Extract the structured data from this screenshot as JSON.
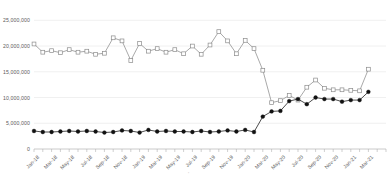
{
  "chart_data": {
    "type": "line",
    "title": "",
    "subtitle": "",
    "xlabel": "",
    "ylabel": "",
    "ylim": [
      0,
      27000000
    ],
    "yticks": [
      0,
      5000000,
      10000000,
      15000000,
      20000000,
      25000000
    ],
    "ytick_labels": [
      "0",
      "5,000,000",
      "10,000,000",
      "15,000,000",
      "20,000,000",
      "25,000,000"
    ],
    "grid": true,
    "grid_axis": "y",
    "legend": "none",
    "x": [
      "Jan-18",
      "Feb-18",
      "Mar-18",
      "Apr-18",
      "May-18",
      "Jun-18",
      "Jul-18",
      "Aug-18",
      "Sep-18",
      "Oct-18",
      "Nov-18",
      "Dec-18",
      "Jan-19",
      "Feb-19",
      "Mar-19",
      "Apr-19",
      "May-19",
      "Jun-19",
      "Jul-19",
      "Aug-19",
      "Sep-19",
      "Oct-19",
      "Nov-19",
      "Dec-19",
      "Jan-20",
      "Feb-20",
      "Mar-20",
      "Apr-20",
      "May-20",
      "Jun-20",
      "Jul-20",
      "Aug-20",
      "Sep-20",
      "Oct-20",
      "Nov-20",
      "Dec-20",
      "Jan-21",
      "Feb-21",
      "Mar-21",
      "Apr-21",
      "May-21"
    ],
    "xtick_labels": [
      "Jan-18",
      "Mar-18",
      "May-18",
      "Jul-18",
      "Sep-18",
      "Nov-18",
      "Jan-19",
      "Mar-19",
      "May-19",
      "Jul-19",
      "Sep-19",
      "Nov-19",
      "Jan-20",
      "Mar-20",
      "May-20",
      "Jul-20",
      "Sep-20",
      "Nov-20",
      "Jan-21",
      "Mar-21"
    ],
    "xtick_step": 2,
    "series": [
      {
        "name": "series-open-square",
        "marker": "open-square",
        "color": "#8c8c8c",
        "fill": "#ffffff",
        "values": [
          20400000,
          18800000,
          19100000,
          18700000,
          19300000,
          18800000,
          19000000,
          18400000,
          18600000,
          21600000,
          21000000,
          17200000,
          20500000,
          19000000,
          19500000,
          18800000,
          19300000,
          18500000,
          20000000,
          18400000,
          20200000,
          22800000,
          21000000,
          18500000,
          21100000,
          19500000,
          15300000,
          9000000,
          9400000,
          10400000,
          9500000,
          12000000,
          13400000,
          11800000,
          11500000,
          11500000,
          11400000,
          11300000,
          15500000,
          null,
          null
        ]
      },
      {
        "name": "series-filled-circle",
        "marker": "filled-circle",
        "color": "#111111",
        "fill": "#111111",
        "values": [
          3500000,
          3300000,
          3300000,
          3400000,
          3500000,
          3400000,
          3500000,
          3400000,
          3200000,
          3300000,
          3600000,
          3500000,
          3200000,
          3700000,
          3400000,
          3500000,
          3400000,
          3400000,
          3300000,
          3500000,
          3300000,
          3400000,
          3600000,
          3400000,
          3700000,
          3300000,
          6300000,
          7300000,
          7400000,
          9300000,
          9700000,
          8700000,
          10000000,
          9700000,
          9700000,
          9200000,
          9500000,
          9500000,
          11100000,
          null,
          null
        ]
      }
    ]
  }
}
